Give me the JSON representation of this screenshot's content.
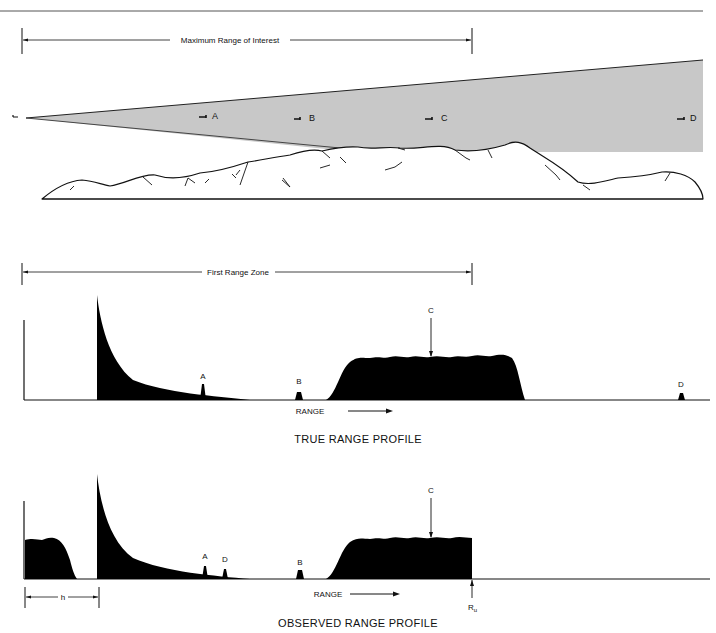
{
  "top_panel": {
    "range_label": "Maximum Range of Interest",
    "targets": [
      "A",
      "B",
      "C",
      "D"
    ],
    "colors": {
      "beam_fill": "#c8c8c8",
      "ink": "#111111"
    }
  },
  "true_profile": {
    "zone_label": "First Range Zone",
    "peak_labels": {
      "A": "A",
      "B": "B",
      "C": "C",
      "D": "D"
    },
    "axis_label": "RANGE",
    "caption": "TRUE RANGE PROFILE"
  },
  "observed_profile": {
    "peak_labels": {
      "A": "A",
      "D": "D",
      "B": "B",
      "C": "C"
    },
    "axis_label": "RANGE",
    "h_label": "h",
    "ru_label": "R",
    "ru_sub": "u",
    "caption": "OBSERVED RANGE PROFILE"
  }
}
